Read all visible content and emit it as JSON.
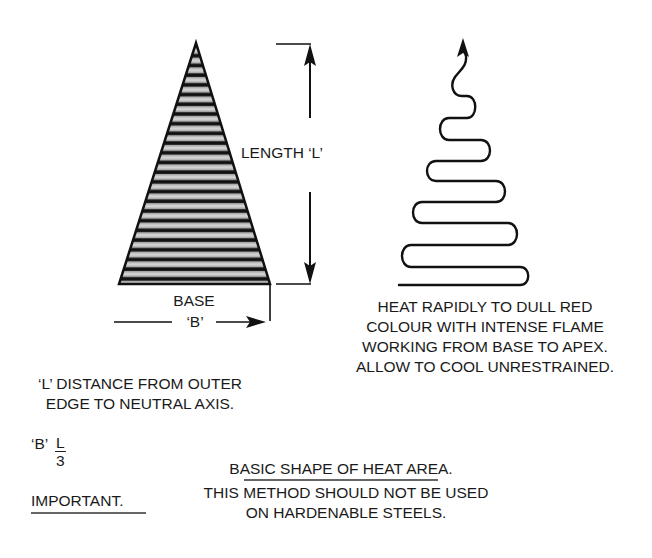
{
  "diagram": {
    "title": "BASIC SHAPE OF HEAT AREA.",
    "triangle": {
      "fill_pattern": "horizontal-stripes",
      "stripe_dark": "#111111",
      "stripe_light": "#c8c8c8",
      "outline": "#111111"
    },
    "labels": {
      "length": "LENGTH ‘L’",
      "base_line1": "BASE",
      "base_line2": "‘B’"
    },
    "heat_instructions": [
      "HEAT RAPIDLY TO DULL RED",
      "COLOUR WITH INTENSE FLAME",
      "WORKING FROM BASE TO APEX.",
      "ALLOW TO COOL UNRESTRAINED."
    ],
    "notes": {
      "l_definition": [
        "‘L’ DISTANCE FROM OUTER",
        "EDGE TO NEUTRAL AXIS."
      ],
      "b_formula": {
        "prefix": "‘B’",
        "numerator": "L",
        "denominator": "3"
      },
      "important_label": "IMPORTANT.",
      "warning": [
        "THIS METHOD SHOULD NOT BE USED",
        "ON HARDENABLE STEELS."
      ]
    },
    "icons": {
      "up_arrow": "arrow-up-icon",
      "down_arrow": "arrow-down-icon",
      "right_arrow": "arrow-right-icon",
      "heat_path_arrow": "heat-path-arrow-icon"
    }
  }
}
